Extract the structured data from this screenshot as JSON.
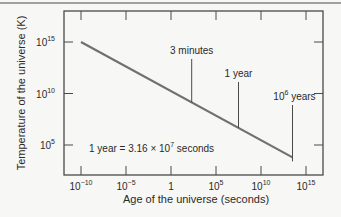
{
  "chart_data": {
    "type": "line",
    "title": "",
    "xlabel": "Age of the universe (seconds)",
    "ylabel": "Temperature of the universe (K)",
    "x_scale": "log",
    "y_scale": "log",
    "xlim_log10": [
      -11.5,
      16.5
    ],
    "ylim_log10": [
      0.5,
      18
    ],
    "x_ticks": [
      {
        "exp": -10,
        "base": "10",
        "sup": "−10"
      },
      {
        "exp": -5,
        "base": "10",
        "sup": "−5"
      },
      {
        "exp": 0,
        "base": "1",
        "sup": ""
      },
      {
        "exp": 5,
        "base": "10",
        "sup": "5"
      },
      {
        "exp": 10,
        "base": "10",
        "sup": "10"
      },
      {
        "exp": 15,
        "base": "10",
        "sup": "15"
      }
    ],
    "y_ticks": [
      {
        "exp": 5,
        "base": "10",
        "sup": "5"
      },
      {
        "exp": 10,
        "base": "10",
        "sup": "10"
      },
      {
        "exp": 15,
        "base": "10",
        "sup": "15"
      }
    ],
    "grid": false,
    "legend": null,
    "series": [
      {
        "name": "Temperature vs age",
        "x_log10": [
          -10,
          13.5
        ],
        "y_log10": [
          15,
          3.8
        ],
        "color": "#707070"
      }
    ],
    "annotations": [
      {
        "label": "3 minutes",
        "x_log10": 2.3,
        "sup": ""
      },
      {
        "label": "1 year",
        "x_log10": 7.5,
        "sup": ""
      },
      {
        "label": " years",
        "prefix": "10",
        "sup": "6",
        "x_log10": 13.5
      }
    ],
    "note": {
      "text": "1 year = 3.16 × 10",
      "sup": "7",
      "suffix": " seconds"
    }
  },
  "colors": {
    "axis": "#4a4a4a",
    "line": "#707070",
    "text": "#2a2a2a",
    "background": "#f7f7f5"
  }
}
